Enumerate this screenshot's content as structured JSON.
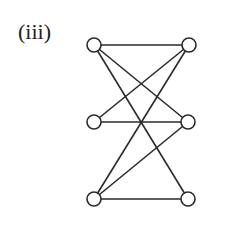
{
  "figure": {
    "label": "(iii)",
    "nodes": [
      {
        "id": "TL",
        "x": 94,
        "y": 45
      },
      {
        "id": "TR",
        "x": 189,
        "y": 45
      },
      {
        "id": "ML",
        "x": 94,
        "y": 122
      },
      {
        "id": "MR",
        "x": 188,
        "y": 122
      },
      {
        "id": "BL",
        "x": 94,
        "y": 199
      },
      {
        "id": "BR",
        "x": 188,
        "y": 199
      }
    ],
    "edges": [
      [
        "TL",
        "TR"
      ],
      [
        "TL",
        "MR"
      ],
      [
        "TL",
        "BR"
      ],
      [
        "ML",
        "TR"
      ],
      [
        "ML",
        "MR"
      ],
      [
        "BL",
        "TR"
      ],
      [
        "BL",
        "MR"
      ],
      [
        "BL",
        "BR"
      ]
    ],
    "node_radius": 7,
    "stroke_color": "#2a2a2a"
  }
}
